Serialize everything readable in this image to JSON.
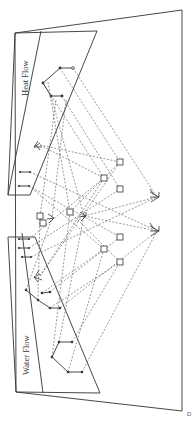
{
  "figure": {
    "orientation": "rotated 90 degrees clockwise",
    "planes": [
      {
        "id": "heat",
        "label": "Heat Flow"
      },
      {
        "id": "water",
        "label": "Water Flow"
      }
    ],
    "corner_mark": "D",
    "colors": {
      "line": "#333333",
      "background": "#ffffff",
      "dashed": "#555555"
    }
  }
}
